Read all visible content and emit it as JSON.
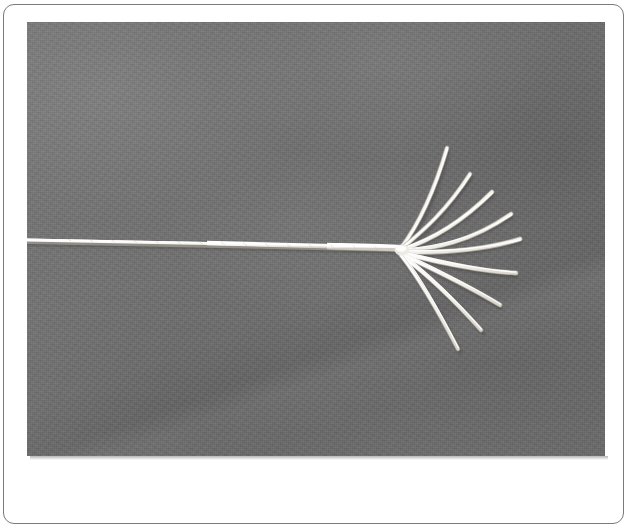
{
  "figure": {
    "kind": "photograph",
    "description": "Black-and-white photograph of a white cord or rope lying on a mid-grey fabric background; the cord runs horizontally from the left edge and its right-hand end is unravelled into a fan of separate white strands.",
    "orientation": "landscape",
    "frame": {
      "border_color": "#7a7a7a",
      "mat_color": "#ffffff",
      "corner_radius_px": 11
    },
    "photo": {
      "background_color": "#6f6f6f",
      "background_description": "even mid-grey woven fabric with soft cloud-like lighting variation and visible film grain",
      "subject_color": "#f2f0ea",
      "highlight_color": "#ffffff",
      "shadow_color": "#3f3f3f",
      "left": 27,
      "top": 22,
      "width": 578,
      "height": 434
    },
    "subject_geometry": {
      "rope_start": [
        27,
        240
      ],
      "rope_end_fan_origin": [
        401,
        248
      ],
      "rope_width_left_px": 3.2,
      "rope_width_right_px": 7.5,
      "strand_count": 9,
      "strands": [
        {
          "id": "strand-1",
          "label": "upper-most",
          "angle_deg": -63,
          "length_px": 112,
          "tip": [
            447,
            148
          ],
          "curve": "bows-left"
        },
        {
          "id": "strand-2",
          "label": "upper",
          "angle_deg": -48,
          "length_px": 104,
          "tip": [
            470,
            172
          ],
          "curve": "bows-left"
        },
        {
          "id": "strand-3",
          "label": "upper-mid",
          "angle_deg": -34,
          "length_px": 108,
          "tip": [
            492,
            190
          ],
          "curve": "slight"
        },
        {
          "id": "strand-4",
          "label": "mid-upper",
          "angle_deg": -20,
          "length_px": 112,
          "tip": [
            511,
            212
          ],
          "curve": "slight"
        },
        {
          "id": "strand-5",
          "label": "middle",
          "angle_deg": -6,
          "length_px": 118,
          "tip": [
            519,
            237
          ],
          "curve": "straight"
        },
        {
          "id": "strand-6",
          "label": "mid-lower",
          "angle_deg": 12,
          "length_px": 115,
          "tip": [
            515,
            270
          ],
          "curve": "straight"
        },
        {
          "id": "strand-7",
          "label": "lower-mid",
          "angle_deg": 28,
          "length_px": 112,
          "tip": [
            500,
            301
          ],
          "curve": "slight"
        },
        {
          "id": "strand-8",
          "label": "lower",
          "angle_deg": 44,
          "length_px": 110,
          "tip": [
            482,
            326
          ],
          "curve": "bows-right"
        },
        {
          "id": "strand-9",
          "label": "lower-most",
          "angle_deg": 62,
          "length_px": 108,
          "tip": [
            459,
            345
          ],
          "curve": "bows-right"
        }
      ]
    }
  }
}
